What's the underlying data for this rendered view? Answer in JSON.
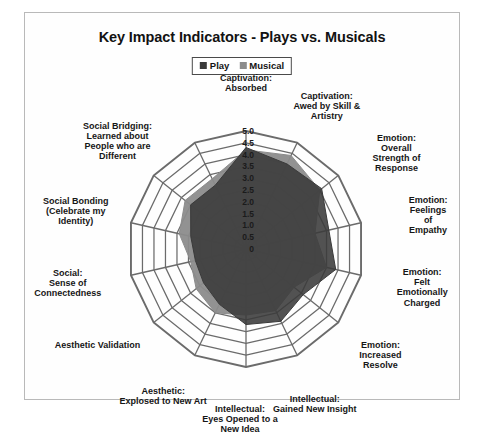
{
  "chart_data": {
    "type": "radar",
    "title": "Key Impact Indicators - Plays vs. Musicals",
    "xlabel": "",
    "ylabel": "",
    "rlim": [
      0,
      5
    ],
    "r_tick_step": 0.5,
    "r_ticks": [
      "5.0",
      "4.5",
      "4.0",
      "3.5",
      "3.0",
      "2.5",
      "2.0",
      "1.5",
      "1.0",
      "0.5",
      "0"
    ],
    "grid": true,
    "legend_position": "top-center",
    "categories": [
      "Captivation:\nAbsorbed",
      "Captivation:\nAwed by Skill &\nArtistry",
      "Emotion:\nOverall Strength of\nResponse",
      "Emotion:\nFeelings of Empathy",
      "Emotion:\nFelt Emotionally\nCharged",
      "Emotion:\nIncreased Resolve",
      "Intellectual:\nGained New Insight",
      "Intellectual:\nEyes Opened to a\nNew Idea",
      "Aesthetic:\nExplosed to New Art",
      "Aesthetic Validation",
      "Social:\nSense of\nConnectedness",
      "Social Bonding\n(Celebrate my\nIdentity)",
      "Social Bridging:\nLearned about\nPeople who are\nDifferent"
    ],
    "series": [
      {
        "name": "Play",
        "color": "#3a3a3a",
        "values": [
          4.3,
          4.0,
          4.1,
          3.6,
          3.9,
          3.1,
          3.4,
          3.2,
          2.6,
          2.3,
          2.2,
          2.4,
          3.0
        ]
      },
      {
        "name": "Musical",
        "color": "#8c8c8c",
        "values": [
          4.2,
          4.4,
          4.0,
          3.0,
          3.5,
          2.6,
          2.9,
          2.8,
          3.0,
          2.7,
          2.4,
          2.9,
          3.3
        ]
      }
    ]
  },
  "legend": {
    "items": [
      {
        "label": "Play",
        "color": "#3a3a3a"
      },
      {
        "label": "Musical",
        "color": "#8c8c8c"
      }
    ]
  },
  "colors": {
    "grid": "#6b6b6b",
    "frame": "#b9b9b9",
    "background": "#ffffff",
    "text": "#161616"
  }
}
